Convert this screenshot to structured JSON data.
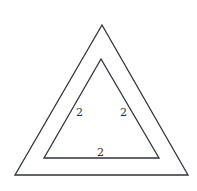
{
  "diagram": {
    "type": "nested-triangles",
    "outer_triangle": {
      "points": [
        [
          102,
          25
        ],
        [
          15,
          175
        ],
        [
          188,
          175
        ]
      ],
      "stroke": "#2f3340"
    },
    "inner_triangle": {
      "points": [
        [
          101,
          59
        ],
        [
          44,
          158
        ],
        [
          159,
          158
        ]
      ],
      "stroke": "#2f3340"
    },
    "labels": {
      "left_side": "2",
      "right_side": "2",
      "bottom_side": "2"
    }
  }
}
